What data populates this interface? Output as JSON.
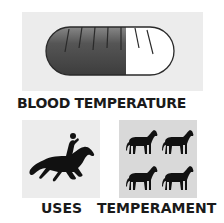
{
  "panels": {
    "blood_temperature": {
      "label": "BLOOD TEMPERATURE",
      "icon": "thermometer-pill-icon",
      "colors": {
        "background": "#ececec",
        "fill": "#4a4a4a",
        "empty": "#ffffff"
      },
      "fill_fraction": 0.62
    },
    "uses": {
      "label": "USES",
      "icon": "galloping-horse-rider-icon",
      "colors": {
        "background": "#ececec",
        "fill": "#111111"
      }
    },
    "temperament": {
      "label": "TEMPERAMENT",
      "icon": "four-horses-icon",
      "colors": {
        "background": "#d9d9d9",
        "fill": "#111111"
      },
      "horse_count": 4
    }
  }
}
